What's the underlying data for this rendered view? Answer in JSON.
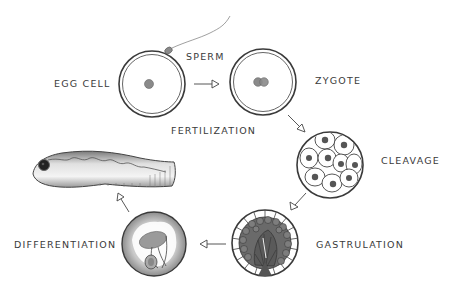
{
  "diagram": {
    "type": "life-cycle",
    "stages": [
      {
        "id": "egg",
        "label": "EGG CELL"
      },
      {
        "id": "zygote",
        "label": "ZYGOTE"
      },
      {
        "id": "cleavage",
        "label": "CLEAVAGE"
      },
      {
        "id": "gastrulation",
        "label": "GASTRULATION"
      },
      {
        "id": "differentiation",
        "label": "DIFFERENTIATION"
      },
      {
        "id": "larva",
        "label": ""
      }
    ],
    "annotations": {
      "sperm": "SPERM",
      "fertilization": "FERTILIZATION"
    },
    "edges": [
      {
        "from": "egg",
        "to": "zygote",
        "label": "FERTILIZATION"
      },
      {
        "from": "zygote",
        "to": "cleavage"
      },
      {
        "from": "cleavage",
        "to": "gastrulation"
      },
      {
        "from": "gastrulation",
        "to": "differentiation"
      },
      {
        "from": "differentiation",
        "to": "larva"
      }
    ],
    "colors": {
      "ink": "#3a3a3a",
      "fill_gray": "#8a8a8a",
      "background": "#ffffff"
    }
  }
}
